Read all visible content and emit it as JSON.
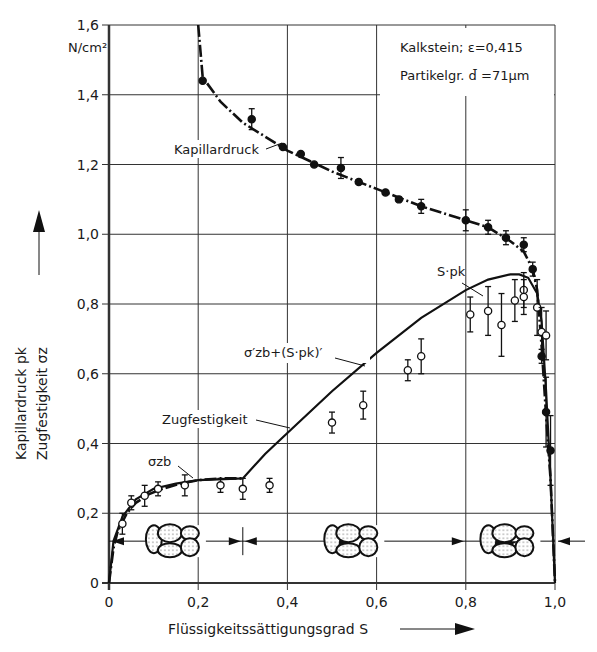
{
  "chart_data": {
    "type": "scatter",
    "title": "",
    "annotations": {
      "material": "Kalkstein; ε=0,415",
      "particle_size": "Partikelgr. d̄ =71µm",
      "unit": "N/cm²",
      "kapillardruck_label": "Kapillardruck",
      "zugfestigkeit_label": "Zugfestigkeit",
      "sigma_zb_label": "σzb",
      "s_pk_label": "S·pk",
      "sum_label": "σ′zb+(S·pk)′"
    },
    "xlabel": "Flüssigkeitssättigungsgrad S",
    "ylabel_line1": "Kapillardruck pk",
    "ylabel_line2": "Zugfestigkeit σz",
    "xlim": [
      0,
      1.0
    ],
    "ylim": [
      0,
      1.6
    ],
    "xticks": [
      "0",
      "0,2",
      "0,4",
      "0,6",
      "0,8",
      "1,0"
    ],
    "yticks": [
      "0",
      "0,2",
      "0,4",
      "0,6",
      "0,8",
      "1,0",
      "1,2",
      "1,4",
      "1,6"
    ],
    "grid": true,
    "series": [
      {
        "name": "Kapillardruck (measured, filled)",
        "marker": "filled-circle",
        "x": [
          0.21,
          0.32,
          0.39,
          0.43,
          0.46,
          0.52,
          0.56,
          0.62,
          0.65,
          0.7,
          0.8,
          0.85,
          0.89,
          0.93,
          0.95,
          0.97,
          0.98,
          0.99
        ],
        "y": [
          1.44,
          1.33,
          1.25,
          1.23,
          1.2,
          1.19,
          1.15,
          1.12,
          1.1,
          1.08,
          1.04,
          1.02,
          0.99,
          0.97,
          0.9,
          0.65,
          0.49,
          0.38
        ],
        "err": [
          0,
          0.03,
          0,
          0,
          0,
          0.03,
          0,
          0,
          0,
          0.02,
          0.03,
          0.02,
          0.02,
          0.02,
          0.02,
          0.02,
          0.1,
          0.1
        ]
      },
      {
        "name": "Zugfestigkeit (measured, open)",
        "marker": "open-circle",
        "x": [
          0.03,
          0.05,
          0.08,
          0.11,
          0.17,
          0.25,
          0.3,
          0.36,
          0.5,
          0.57,
          0.67,
          0.7,
          0.81,
          0.85,
          0.88,
          0.91,
          0.93,
          0.93,
          0.96,
          0.97,
          0.98
        ],
        "y": [
          0.17,
          0.23,
          0.25,
          0.27,
          0.28,
          0.28,
          0.27,
          0.28,
          0.46,
          0.51,
          0.61,
          0.65,
          0.77,
          0.78,
          0.74,
          0.81,
          0.84,
          0.82,
          0.79,
          0.72,
          0.71
        ],
        "err": [
          0.03,
          0.02,
          0.03,
          0.02,
          0.03,
          0.02,
          0.03,
          0.02,
          0.03,
          0.04,
          0.03,
          0.05,
          0.05,
          0.07,
          0.09,
          0.06,
          0.05,
          0.05,
          0.08,
          0.07,
          0.07
        ]
      },
      {
        "name": "Kapillardruck curve",
        "style": "dash-dot",
        "x": [
          0.2,
          0.21,
          0.25,
          0.3,
          0.35,
          0.4,
          0.45,
          0.5,
          0.6,
          0.7,
          0.8,
          0.85,
          0.9,
          0.93,
          0.95,
          0.96,
          0.97,
          0.98,
          0.99,
          1.0
        ],
        "y": [
          1.6,
          1.45,
          1.38,
          1.32,
          1.28,
          1.24,
          1.21,
          1.18,
          1.13,
          1.08,
          1.04,
          1.02,
          0.98,
          0.95,
          0.9,
          0.84,
          0.68,
          0.48,
          0.3,
          0.0
        ]
      },
      {
        "name": "σzb",
        "style": "dash-dot",
        "x": [
          0.0,
          0.01,
          0.02,
          0.04,
          0.06,
          0.09,
          0.12,
          0.16,
          0.2,
          0.25,
          0.3
        ],
        "y": [
          0.0,
          0.1,
          0.15,
          0.2,
          0.23,
          0.255,
          0.27,
          0.285,
          0.295,
          0.3,
          0.3
        ]
      },
      {
        "name": "Zugfestigkeit curve (solid)",
        "style": "solid",
        "x": [
          0.0,
          0.01,
          0.03,
          0.06,
          0.1,
          0.15,
          0.2,
          0.3,
          0.35,
          0.4,
          0.5,
          0.6,
          0.7,
          0.8,
          0.85,
          0.9,
          0.92,
          0.94,
          0.96,
          0.97,
          0.98,
          0.99,
          1.0
        ],
        "y": [
          0.0,
          0.12,
          0.19,
          0.24,
          0.27,
          0.285,
          0.295,
          0.3,
          0.37,
          0.43,
          0.55,
          0.66,
          0.76,
          0.84,
          0.87,
          0.885,
          0.885,
          0.875,
          0.83,
          0.75,
          0.55,
          0.3,
          0.0
        ]
      }
    ],
    "particle_diagrams": [
      {
        "range": [
          0,
          0.3
        ],
        "state": "pendular"
      },
      {
        "range": [
          0.3,
          0.8
        ],
        "state": "funicular"
      },
      {
        "range": [
          0.8,
          1.0
        ],
        "state": "capillary"
      }
    ]
  }
}
